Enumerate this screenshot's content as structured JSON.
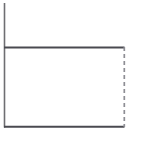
{
  "figure": {
    "title": "",
    "background_color": "#ffffff",
    "width": 141,
    "height": 142
  },
  "colors": {
    "axis": "#6e6e72",
    "solid_line": "#4a4a50",
    "dashed_line": "#8e8e94",
    "background": "#ffffff"
  },
  "axes": {
    "y_axis": {
      "name": "y-axis-spine",
      "x": 4,
      "y_top": 3,
      "y_bottom": 127,
      "visible": true,
      "tick_labels": [],
      "label": ""
    },
    "x_axis": {
      "name": "x-axis-baseline",
      "y": 127,
      "x_left": 4,
      "x_right": 124,
      "visible": true,
      "tick_labels": [],
      "label": ""
    }
  },
  "chart_data": {
    "type": "line",
    "title": "",
    "subtitle": "",
    "xlabel": "",
    "ylabel": "",
    "xlim": [
      0,
      1
    ],
    "ylim": [
      0,
      1
    ],
    "grid": false,
    "legend": null,
    "legend_position": "none",
    "tick_labels_x": [],
    "tick_labels_y": [],
    "annotations": [],
    "series": [
      {
        "name": "plateau-top",
        "style": "solid",
        "color": "#4a4a50",
        "x": [
          0.0,
          1.0
        ],
        "y": [
          0.645,
          0.645
        ],
        "description": "Horizontal solid line forming the top of the rectangle"
      },
      {
        "name": "baseline-bottom",
        "style": "solid",
        "color": "#4a4a50",
        "x": [
          0.0,
          1.0
        ],
        "y": [
          0.0,
          0.0
        ],
        "description": "Horizontal solid line forming the bottom of the rectangle"
      },
      {
        "name": "right-edge-drop",
        "style": "dashed",
        "color": "#8e8e94",
        "x": [
          1.0,
          1.0
        ],
        "y": [
          0.645,
          0.0
        ],
        "description": "Vertical dashed line closing the right side of the rectangle"
      }
    ]
  },
  "geometry": {
    "y_axis_x": 4,
    "y_axis_top": 3,
    "plateau_y": 47,
    "baseline_y": 127,
    "left_x": 4,
    "right_x": 124,
    "dash_pattern": "4 3"
  }
}
